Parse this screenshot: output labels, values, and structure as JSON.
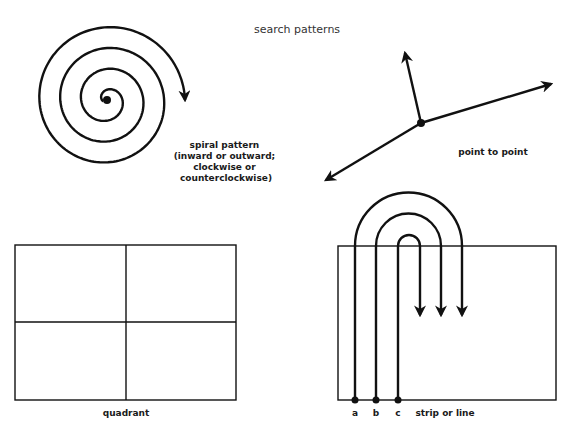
{
  "title": "search patterns",
  "panels": {
    "spiral": {
      "label_lines": [
        "spiral pattern",
        "(inward or outward;",
        "clockwise or",
        "counterclockwise)"
      ]
    },
    "point_to_point": {
      "label": "point to point"
    },
    "quadrant": {
      "label": "quadrant"
    },
    "strip": {
      "label": "strip or line",
      "start_points": [
        "a",
        "b",
        "c"
      ]
    }
  }
}
